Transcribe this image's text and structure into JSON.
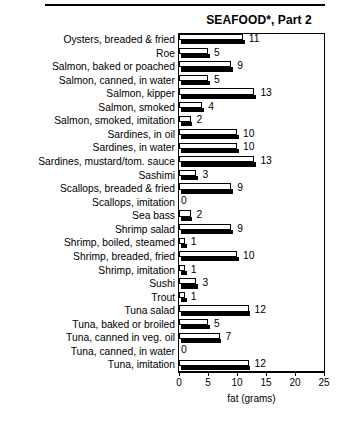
{
  "chart_data": {
    "type": "bar",
    "orientation": "horizontal",
    "title": "SEAFOOD*, Part 2",
    "xlabel": "fat (grams)",
    "ylabel": "",
    "xlim": [
      0,
      25
    ],
    "xticks": [
      0,
      5,
      10,
      15,
      20,
      25
    ],
    "grid": false,
    "legend": null,
    "categories": [
      "Oysters, breaded & fried",
      "Roe",
      "Salmon, baked or poached",
      "Salmon, canned, in water",
      "Salmon, kipper",
      "Salmon, smoked",
      "Salmon, smoked,  imitation",
      "Sardines, in oil",
      "Sardines, in water",
      "Sardines, mustard/tom. sauce",
      "Sashimi",
      "Scallops, breaded & fried",
      "Scallops, imitation",
      "Sea bass",
      "Shrimp salad",
      "Shrimp, boiled, steamed",
      "Shrimp, breaded, fried",
      "Shrimp, imitation",
      "Sushi",
      "Trout",
      "Tuna salad",
      "Tuna, baked or broiled",
      "Tuna, canned in veg. oil",
      "Tuna, canned, in water",
      "Tuna, imitation"
    ],
    "values": [
      11,
      5,
      9,
      5,
      13,
      4,
      2,
      10,
      10,
      13,
      3,
      9,
      0,
      2,
      9,
      1,
      10,
      1,
      3,
      1,
      12,
      5,
      7,
      0,
      12
    ],
    "value_labels": [
      "11",
      "5",
      "9",
      "5",
      "13",
      "4",
      "2",
      "10",
      "10",
      "13",
      "3",
      "9",
      "0",
      "2",
      "9",
      "1",
      "10",
      "1",
      "3",
      "1",
      "12",
      "5",
      "7",
      "0",
      "12"
    ],
    "colors": {
      "bar_face": "#ffffff",
      "bar_outline": "#000000",
      "bar_shadow": "#000000",
      "text": "#000000",
      "background": "#ffffff"
    }
  }
}
